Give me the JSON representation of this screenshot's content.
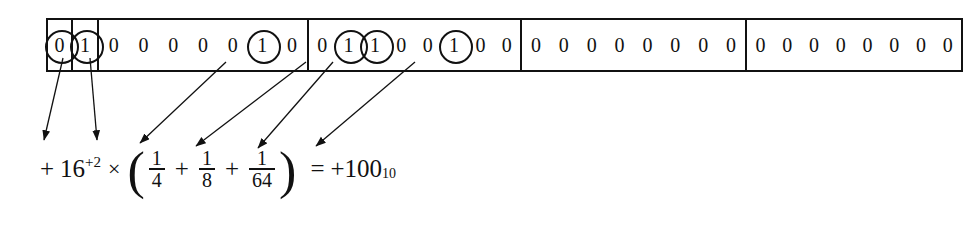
{
  "diagram": {
    "line_color": "#111111",
    "background": "#ffffff",
    "groups": [
      {
        "name": "sign-bit",
        "bit_count": 1,
        "bits": [
          {
            "value": "0",
            "circled": true
          }
        ]
      },
      {
        "name": "exponent-sign-bit",
        "bit_count": 1,
        "bits": [
          {
            "value": "1",
            "circled": true
          }
        ]
      },
      {
        "name": "exponent-field",
        "bit_count": 7,
        "bits": [
          {
            "value": "0",
            "circled": false
          },
          {
            "value": "0",
            "circled": false
          },
          {
            "value": "0",
            "circled": false
          },
          {
            "value": "0",
            "circled": false
          },
          {
            "value": "0",
            "circled": false
          },
          {
            "value": "1",
            "circled": true
          },
          {
            "value": "0",
            "circled": false
          }
        ]
      },
      {
        "name": "mantissa-byte-1",
        "bit_count": 8,
        "bits": [
          {
            "value": "0",
            "circled": false
          },
          {
            "value": "1",
            "circled": true
          },
          {
            "value": "1",
            "circled": true
          },
          {
            "value": "0",
            "circled": false
          },
          {
            "value": "0",
            "circled": false
          },
          {
            "value": "1",
            "circled": true
          },
          {
            "value": "0",
            "circled": false
          },
          {
            "value": "0",
            "circled": false
          }
        ]
      },
      {
        "name": "mantissa-byte-2",
        "bit_count": 8,
        "bits": [
          {
            "value": "0",
            "circled": false
          },
          {
            "value": "0",
            "circled": false
          },
          {
            "value": "0",
            "circled": false
          },
          {
            "value": "0",
            "circled": false
          },
          {
            "value": "0",
            "circled": false
          },
          {
            "value": "0",
            "circled": false
          },
          {
            "value": "0",
            "circled": false
          },
          {
            "value": "0",
            "circled": false
          }
        ]
      },
      {
        "name": "mantissa-byte-3",
        "bit_count": 8,
        "bits": [
          {
            "value": "0",
            "circled": false
          },
          {
            "value": "0",
            "circled": false
          },
          {
            "value": "0",
            "circled": false
          },
          {
            "value": "0",
            "circled": false
          },
          {
            "value": "0",
            "circled": false
          },
          {
            "value": "0",
            "circled": false
          },
          {
            "value": "0",
            "circled": false
          },
          {
            "value": "0",
            "circled": false
          }
        ]
      }
    ]
  },
  "formula": {
    "sign": "+",
    "base": "16",
    "exponent": "+2",
    "times": "×",
    "open_paren": "(",
    "close_paren": ")",
    "terms": [
      {
        "numerator": "1",
        "denominator": "4"
      },
      {
        "numerator": "1",
        "denominator": "8"
      },
      {
        "numerator": "1",
        "denominator": "64"
      }
    ],
    "plus": "+",
    "equals": "=",
    "result_sign": "+",
    "result_value": "100",
    "result_subscript": "10"
  }
}
